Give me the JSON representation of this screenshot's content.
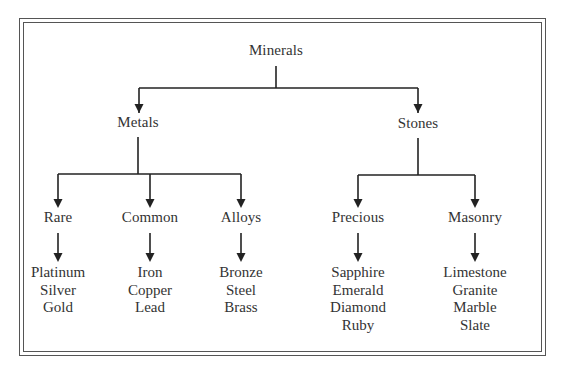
{
  "diagram": {
    "type": "hierarchy-tree",
    "colors": {
      "text": "#333333",
      "lines": "#222222",
      "frame": "#555555",
      "background": "#ffffff"
    },
    "root": {
      "label": "Minerals"
    },
    "level1": [
      {
        "label": "Metals"
      },
      {
        "label": "Stones"
      }
    ],
    "level2": [
      {
        "label": "Rare",
        "parent": "Metals",
        "items": [
          "Platinum",
          "Silver",
          "Gold"
        ]
      },
      {
        "label": "Common",
        "parent": "Metals",
        "items": [
          "Iron",
          "Copper",
          "Lead"
        ]
      },
      {
        "label": "Alloys",
        "parent": "Metals",
        "items": [
          "Bronze",
          "Steel",
          "Brass"
        ]
      },
      {
        "label": "Precious",
        "parent": "Stones",
        "items": [
          "Sapphire",
          "Emerald",
          "Diamond",
          "Ruby"
        ]
      },
      {
        "label": "Masonry",
        "parent": "Stones",
        "items": [
          "Limestone",
          "Granite",
          "Marble",
          "Slate"
        ]
      }
    ]
  }
}
